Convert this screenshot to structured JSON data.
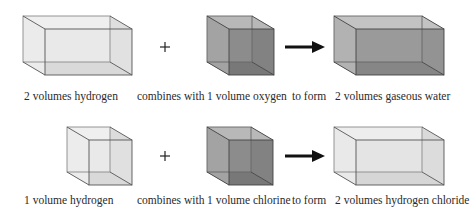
{
  "colors": {
    "edge": "#5a5a5a",
    "hydrogen_fill": "#e6e6e6",
    "hydrogen_floor": "#c8c8c8",
    "dark_fill": "#9a9a9a",
    "dark_floor": "#6f6f6f",
    "mid_fill": "#a9a9a9",
    "mid_floor": "#7e7e7e",
    "hcl_fill": "#e2e2e2",
    "hcl_floor": "#c6c6c6",
    "arrow": "#111111"
  },
  "rows": [
    {
      "reactant1": {
        "label": "2 volumes hydrogen",
        "shape": "wide-box"
      },
      "operator": "+",
      "connector": "combines with",
      "reactant2": {
        "label": "1 volume oxygen",
        "shape": "cube"
      },
      "relation": "to form",
      "product": {
        "label": "2 volumes gaseous water",
        "shape": "wide-box"
      }
    },
    {
      "reactant1": {
        "label": "1 volume hydrogen",
        "shape": "cube"
      },
      "operator": "+",
      "connector": "combines with",
      "reactant2": {
        "label": "1 volume chlorine",
        "shape": "cube"
      },
      "relation": "to form",
      "product": {
        "label": "2 volumes hydrogen chloride",
        "shape": "wide-box"
      }
    }
  ]
}
